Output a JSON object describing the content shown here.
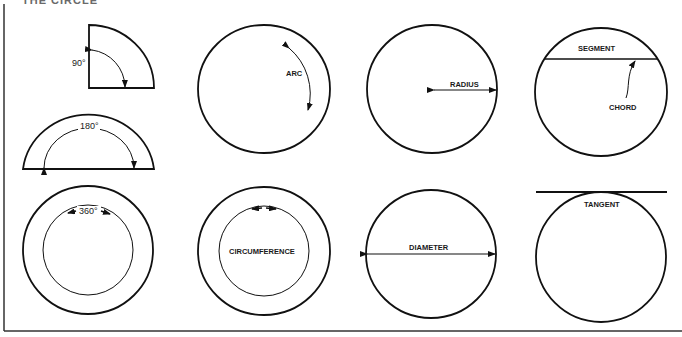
{
  "header": {
    "title_partial": "THE CIRCLE"
  },
  "figures": {
    "quarter": {
      "label": "90°"
    },
    "half": {
      "label": "180°"
    },
    "full": {
      "label": "360°"
    },
    "arc": {
      "label": "ARC"
    },
    "circumference": {
      "label": "CIRCUMFERENCE"
    },
    "radius": {
      "label": "RADIUS"
    },
    "diameter": {
      "label": "DIAMETER"
    },
    "segment": {
      "label": "SEGMENT"
    },
    "chord": {
      "label": "CHORD"
    },
    "tangent": {
      "label": "TANGENT"
    }
  },
  "colors": {
    "line": "#111111",
    "background": "#ffffff"
  }
}
